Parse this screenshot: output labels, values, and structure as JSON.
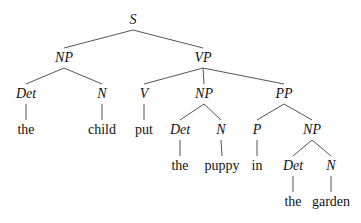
{
  "diagram": {
    "type": "syntax-tree",
    "nodes": [
      {
        "id": "S",
        "label": "S",
        "kind": "category"
      },
      {
        "id": "NP1",
        "label": "NP",
        "kind": "category",
        "parent": "S"
      },
      {
        "id": "VP",
        "label": "VP",
        "kind": "category",
        "parent": "S"
      },
      {
        "id": "Det1",
        "label": "Det",
        "kind": "category",
        "parent": "NP1"
      },
      {
        "id": "N1",
        "label": "N",
        "kind": "category",
        "parent": "NP1"
      },
      {
        "id": "V",
        "label": "V",
        "kind": "category",
        "parent": "VP"
      },
      {
        "id": "NP2",
        "label": "NP",
        "kind": "category",
        "parent": "VP"
      },
      {
        "id": "PP",
        "label": "PP",
        "kind": "category",
        "parent": "VP"
      },
      {
        "id": "w_the1",
        "label": "the",
        "kind": "word",
        "parent": "Det1"
      },
      {
        "id": "w_child",
        "label": "child",
        "kind": "word",
        "parent": "N1"
      },
      {
        "id": "w_put",
        "label": "put",
        "kind": "word",
        "parent": "V"
      },
      {
        "id": "Det2",
        "label": "Det",
        "kind": "category",
        "parent": "NP2"
      },
      {
        "id": "N2",
        "label": "N",
        "kind": "category",
        "parent": "NP2"
      },
      {
        "id": "P",
        "label": "P",
        "kind": "category",
        "parent": "PP"
      },
      {
        "id": "NP3",
        "label": "NP",
        "kind": "category",
        "parent": "PP"
      },
      {
        "id": "w_the2",
        "label": "the",
        "kind": "word",
        "parent": "Det2"
      },
      {
        "id": "w_puppy",
        "label": "puppy",
        "kind": "word",
        "parent": "N2"
      },
      {
        "id": "w_in",
        "label": "in",
        "kind": "word",
        "parent": "P"
      },
      {
        "id": "Det3",
        "label": "Det",
        "kind": "category",
        "parent": "NP3"
      },
      {
        "id": "N3",
        "label": "N",
        "kind": "category",
        "parent": "NP3"
      },
      {
        "id": "w_the3",
        "label": "the",
        "kind": "word",
        "parent": "Det3"
      },
      {
        "id": "w_garden",
        "label": "garden",
        "kind": "word",
        "parent": "N3"
      }
    ]
  }
}
